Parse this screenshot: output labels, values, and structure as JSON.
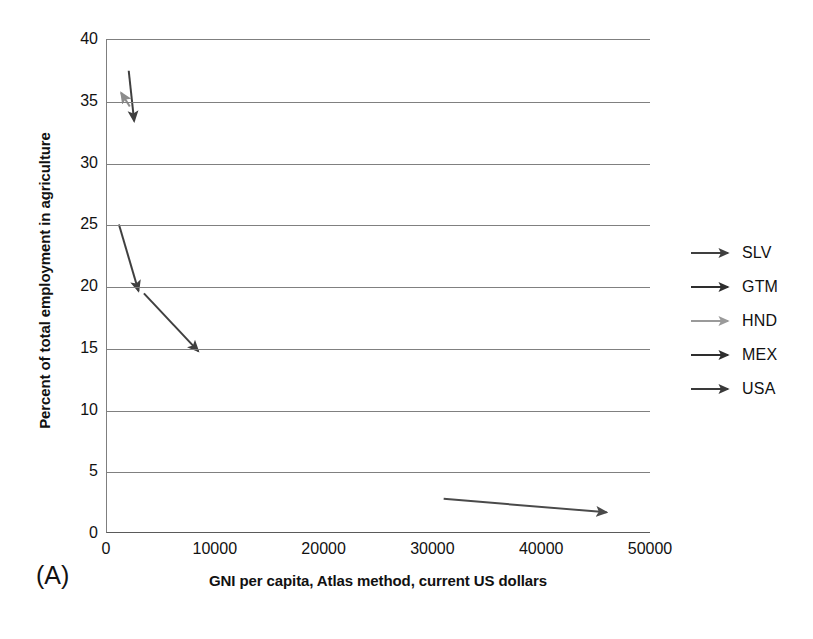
{
  "panel": {
    "label": "(A)"
  },
  "chart_data": {
    "type": "line",
    "title": "",
    "xlabel": "GNI per capita, Atlas method, current US dollars",
    "ylabel": "Percent of total employment in agriculture",
    "xlim": [
      0,
      50000
    ],
    "ylim": [
      0,
      40
    ],
    "xticks": [
      0,
      10000,
      20000,
      30000,
      40000,
      50000
    ],
    "xtick_labels": [
      "0",
      "10000",
      "20000",
      "30000",
      "40000",
      "50000"
    ],
    "yticks": [
      0,
      5,
      10,
      15,
      20,
      25,
      30,
      35,
      40
    ],
    "ytick_labels": [
      "0",
      "5",
      "10",
      "15",
      "20",
      "25",
      "30",
      "35",
      "40"
    ],
    "grid": "horizontal",
    "legend_position": "right",
    "series": [
      {
        "name": "SLV",
        "color": "#3f3f3f",
        "marker": "arrow",
        "start": {
          "x": 2000,
          "y": 37.5
        },
        "end": {
          "x": 2500,
          "y": 33.4
        }
      },
      {
        "name": "GTM",
        "color": "#3f3f3f",
        "marker": "arrow",
        "start": {
          "x": 1100,
          "y": 25.0
        },
        "end": {
          "x": 2900,
          "y": 19.6
        }
      },
      {
        "name": "HND",
        "color": "#8c8c8c",
        "marker": "arrow",
        "start": {
          "x": 2100,
          "y": 34.6
        },
        "end": {
          "x": 1300,
          "y": 35.7
        }
      },
      {
        "name": "MEX",
        "color": "#3f3f3f",
        "marker": "arrow",
        "start": {
          "x": 3400,
          "y": 19.4
        },
        "end": {
          "x": 8400,
          "y": 14.7
        }
      },
      {
        "name": "USA",
        "color": "#4a4a4a",
        "marker": "arrow",
        "start": {
          "x": 31000,
          "y": 2.7
        },
        "end": {
          "x": 46000,
          "y": 1.6
        }
      }
    ]
  },
  "legend": {
    "items": [
      {
        "label": "SLV",
        "color": "#3f3f3f"
      },
      {
        "label": "GTM",
        "color": "#2e2e2e"
      },
      {
        "label": "HND",
        "color": "#9a9a9a"
      },
      {
        "label": "MEX",
        "color": "#2e2e2e"
      },
      {
        "label": "USA",
        "color": "#3a3a3a"
      }
    ]
  },
  "colors": {
    "gridline": "#808080",
    "axis": "#5a5a5a",
    "text": "#111111"
  }
}
